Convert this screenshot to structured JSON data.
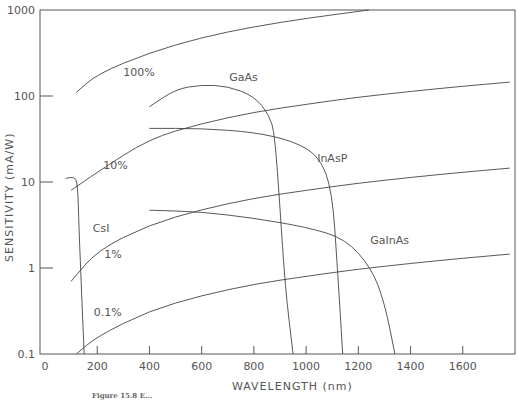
{
  "chart_data": {
    "type": "line",
    "title": "",
    "xlabel": "WAVELENGTH (nm)",
    "ylabel": "SENSITIVITY (mA/W)",
    "xlim": [
      0,
      1800
    ],
    "ylim": [
      0.1,
      1000
    ],
    "yscale": "log",
    "grid": false,
    "x_ticks": [
      0,
      200,
      400,
      600,
      800,
      1000,
      1200,
      1400,
      1600
    ],
    "x_tick_labels": [
      "0",
      "200",
      "400",
      "600",
      "800",
      "1000",
      "1200",
      "1400",
      "1600"
    ],
    "y_ticks": [
      0.1,
      1,
      10,
      100,
      1000
    ],
    "y_tick_labels": [
      "0.1",
      "1",
      "10",
      "100",
      "1000"
    ],
    "series": [
      {
        "name": "100%",
        "kind": "quantum-efficiency-line",
        "points": [
          [
            120,
            110
          ],
          [
            200,
            180
          ],
          [
            400,
            320
          ],
          [
            600,
            480
          ],
          [
            800,
            640
          ],
          [
            1000,
            800
          ],
          [
            1240,
            1000
          ]
        ]
      },
      {
        "name": "10%",
        "kind": "quantum-efficiency-line",
        "points": [
          [
            100,
            8
          ],
          [
            200,
            13
          ],
          [
            400,
            32
          ],
          [
            600,
            48
          ],
          [
            800,
            65
          ],
          [
            1000,
            80
          ],
          [
            1200,
            97
          ],
          [
            1400,
            113
          ],
          [
            1600,
            130
          ],
          [
            1780,
            145
          ]
        ]
      },
      {
        "name": "1%",
        "kind": "quantum-efficiency-line",
        "points": [
          [
            100,
            0.7
          ],
          [
            200,
            1.6
          ],
          [
            400,
            3.2
          ],
          [
            600,
            4.8
          ],
          [
            800,
            6.5
          ],
          [
            1000,
            8
          ],
          [
            1200,
            9.7
          ],
          [
            1400,
            11.3
          ],
          [
            1600,
            13
          ],
          [
            1780,
            14.5
          ]
        ]
      },
      {
        "name": "0.1%",
        "kind": "quantum-efficiency-line",
        "points": [
          [
            120,
            0.1
          ],
          [
            200,
            0.16
          ],
          [
            400,
            0.32
          ],
          [
            600,
            0.48
          ],
          [
            800,
            0.65
          ],
          [
            1000,
            0.8
          ],
          [
            1200,
            0.97
          ],
          [
            1400,
            1.13
          ],
          [
            1600,
            1.3
          ],
          [
            1780,
            1.45
          ]
        ]
      },
      {
        "name": "CsI",
        "points": [
          [
            80,
            11
          ],
          [
            110,
            11.5
          ],
          [
            125,
            10
          ],
          [
            130,
            3
          ],
          [
            140,
            0.5
          ],
          [
            150,
            0.1
          ]
        ]
      },
      {
        "name": "GaAs",
        "points": [
          [
            400,
            75
          ],
          [
            500,
            120
          ],
          [
            600,
            135
          ],
          [
            700,
            130
          ],
          [
            800,
            100
          ],
          [
            860,
            60
          ],
          [
            880,
            35
          ],
          [
            900,
            5
          ],
          [
            920,
            0.6
          ],
          [
            950,
            0.1
          ]
        ]
      },
      {
        "name": "InAsP",
        "points": [
          [
            400,
            42
          ],
          [
            600,
            42
          ],
          [
            800,
            38
          ],
          [
            950,
            30
          ],
          [
            1050,
            20
          ],
          [
            1100,
            8
          ],
          [
            1120,
            1
          ],
          [
            1140,
            0.1
          ]
        ]
      },
      {
        "name": "GaInAs",
        "points": [
          [
            400,
            4.7
          ],
          [
            600,
            4.5
          ],
          [
            800,
            3.8
          ],
          [
            1000,
            3
          ],
          [
            1150,
            2.2
          ],
          [
            1250,
            1
          ],
          [
            1300,
            0.4
          ],
          [
            1340,
            0.1
          ]
        ]
      }
    ],
    "annotations": [
      {
        "text": "100%",
        "x": 360,
        "y": 170
      },
      {
        "text": "10%",
        "x": 270,
        "y": 14
      },
      {
        "text": "1%",
        "x": 260,
        "y": 1.3
      },
      {
        "text": "0.1%",
        "x": 240,
        "y": 0.28
      },
      {
        "text": "CsI",
        "x": 215,
        "y": 2.6
      },
      {
        "text": "GaAs",
        "x": 760,
        "y": 150
      },
      {
        "text": "InAsP",
        "x": 1100,
        "y": 17
      },
      {
        "text": "GaInAs",
        "x": 1320,
        "y": 1.9
      }
    ]
  },
  "labels": {
    "y_axis_title": "SENSITIVITY (mA/W)",
    "x_axis_title": "WAVELENGTH (nm)",
    "caption": "Figure 15.8   E..."
  }
}
